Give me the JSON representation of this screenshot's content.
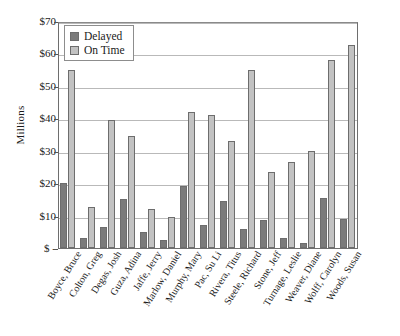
{
  "chart_data": {
    "type": "bar",
    "title": "",
    "xlabel": "",
    "ylabel": "Millions",
    "ylim": [
      0,
      70
    ],
    "grid": true,
    "legend_position": "top-left",
    "ytick_labels": [
      "$70",
      "$60",
      "$50",
      "$40",
      "$30",
      "$20",
      "$10",
      "$ -"
    ],
    "ytick_values": [
      70,
      60,
      50,
      40,
      30,
      20,
      10,
      0
    ],
    "categories": [
      "Boyce, Bruce",
      "Colton, Greg",
      "Degas, Josh",
      "Guza, Adina",
      "Jaffe, Jerry",
      "Marlow, Daniel",
      "Murphy, Mary",
      "Pac, Su Li",
      "Rivera, Titus",
      "Steele, Richard",
      "Stone, Jeff",
      "Turnage, Leslie",
      "Weaver, Diane",
      "Wolff, Carolyn",
      "Woods, Susan"
    ],
    "series": [
      {
        "name": "Delayed",
        "color": "#7b7b7b",
        "values": [
          20.0,
          3.0,
          6.5,
          15.0,
          5.0,
          2.5,
          19.0,
          7.0,
          14.5,
          6.0,
          8.5,
          3.0,
          1.5,
          15.5,
          9.0
        ]
      },
      {
        "name": "On Time",
        "color": "#c2c2c2",
        "values": [
          55.0,
          12.5,
          39.5,
          34.5,
          12.0,
          9.5,
          42.0,
          41.0,
          33.0,
          55.0,
          23.5,
          26.5,
          30.0,
          58.0,
          62.5
        ]
      }
    ]
  },
  "legend": {
    "items": [
      {
        "label": "Delayed",
        "swatch": "delayed"
      },
      {
        "label": "On Time",
        "swatch": "ontime"
      }
    ]
  }
}
